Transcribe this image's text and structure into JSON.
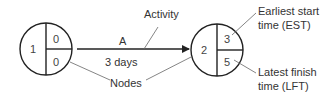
{
  "nodes": [
    {
      "id": "1",
      "est": "0",
      "lft": "0"
    },
    {
      "id": "2",
      "est": "3",
      "lft": "5"
    }
  ],
  "activity": {
    "name": "A",
    "duration": "3 days"
  },
  "annotations": {
    "activity": "Activity",
    "nodes": "Nodes",
    "est_line1": "Earliest start",
    "est_line2": "time (EST)",
    "lft_line1": "Latest finish",
    "lft_line2": "time (LFT)"
  },
  "colors": {
    "stroke": "#222222",
    "leader": "#666666",
    "text": "#333333"
  }
}
